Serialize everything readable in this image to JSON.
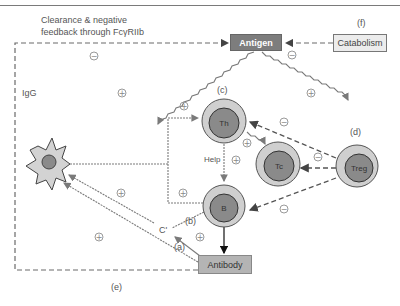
{
  "title_rule": true,
  "nodes": {
    "antigen": {
      "label": "Antigen",
      "color": "#7d7d7d"
    },
    "catabolism": {
      "label": "Catabolism",
      "color": "#ececec"
    },
    "antibody": {
      "label": "Antibody",
      "color": "#b4b4b4"
    },
    "th": {
      "label": "Th"
    },
    "tc": {
      "label": "Tc"
    },
    "treg": {
      "label": "Treg"
    },
    "b": {
      "label": "B"
    },
    "apc": {
      "label": "Antigen-presenting cell"
    }
  },
  "labels": {
    "clearance_line1": "Clearance & negative",
    "clearance_line2": "feedback through FcγRIIb",
    "igg": "IgG",
    "help": "Help",
    "c_prime": "C'",
    "a": "(a)",
    "b": "(b)",
    "c": "(c)",
    "d": "(d)",
    "e": "(e)",
    "f": "(f)"
  },
  "signs": {
    "plus": "+",
    "minus": "−"
  },
  "colors": {
    "line": "#7a7a7a",
    "cell_outer": "#cfcfcf",
    "cell_inner": "#8a8a8a",
    "cell_border": "#555555"
  }
}
